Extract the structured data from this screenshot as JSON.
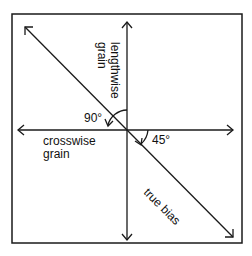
{
  "diagram": {
    "labels": {
      "lengthwise": [
        "lengthwise",
        "grain"
      ],
      "crosswise": [
        "crosswise",
        "grain"
      ],
      "true_bias": "true bias",
      "angle_90": "90°",
      "angle_45": "45°"
    },
    "colors": {
      "stroke": "#1a1a1a",
      "background": "#ffffff"
    }
  }
}
